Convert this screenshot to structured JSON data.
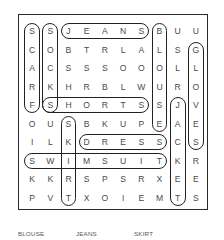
{
  "puzzle": {
    "rows": 10,
    "cols": 10,
    "grid": [
      [
        "S",
        "S",
        "J",
        "E",
        "A",
        "N",
        "S",
        "B",
        "U",
        "U"
      ],
      [
        "C",
        "O",
        "B",
        "T",
        "R",
        "L",
        "A",
        "L",
        "S",
        "G"
      ],
      [
        "A",
        "C",
        "S",
        "S",
        "S",
        "O",
        "O",
        "O",
        "L",
        "L"
      ],
      [
        "R",
        "K",
        "H",
        "R",
        "B",
        "L",
        "W",
        "U",
        "R",
        "O"
      ],
      [
        "F",
        "S",
        "H",
        "O",
        "R",
        "T",
        "S",
        "S",
        "J",
        "V"
      ],
      [
        "O",
        "U",
        "S",
        "B",
        "K",
        "U",
        "P",
        "E",
        "A",
        "E"
      ],
      [
        "I",
        "L",
        "K",
        "D",
        "R",
        "E",
        "S",
        "S",
        "C",
        "S"
      ],
      [
        "S",
        "W",
        "I",
        "M",
        "S",
        "U",
        "I",
        "T",
        "K",
        "R"
      ],
      [
        "K",
        "K",
        "R",
        "S",
        "P",
        "S",
        "R",
        "X",
        "E",
        "E"
      ],
      [
        "P",
        "V",
        "T",
        "X",
        "O",
        "I",
        "E",
        "M",
        "T",
        "S"
      ]
    ],
    "found_words": [
      {
        "word": "SCARF",
        "row": 0,
        "col": 0,
        "dir": "down",
        "length": 5
      },
      {
        "word": "SOCKS",
        "row": 0,
        "col": 1,
        "dir": "down",
        "length": 5
      },
      {
        "word": "JEANS",
        "row": 0,
        "col": 2,
        "dir": "right",
        "length": 5
      },
      {
        "word": "BLOUSE",
        "row": 0,
        "col": 7,
        "dir": "down",
        "length": 6
      },
      {
        "word": "GLOVES",
        "row": 1,
        "col": 9,
        "dir": "down",
        "length": 6
      },
      {
        "word": "SHORTS",
        "row": 4,
        "col": 1,
        "dir": "right",
        "length": 6
      },
      {
        "word": "JACKET",
        "row": 4,
        "col": 8,
        "dir": "down",
        "length": 6
      },
      {
        "word": "SKIRT",
        "row": 5,
        "col": 2,
        "dir": "down",
        "length": 5
      },
      {
        "word": "DRESS",
        "row": 6,
        "col": 3,
        "dir": "right",
        "length": 5
      },
      {
        "word": "SWIMSUIT",
        "row": 7,
        "col": 0,
        "dir": "right",
        "length": 8
      }
    ],
    "colors": {
      "frame": "#2a2a2a",
      "capsule": "#222222",
      "letter": "#4a4a4a",
      "word_list": "#555555"
    }
  },
  "word_list": {
    "items": [
      "BLOUSE",
      "JEANS",
      "SKIRT"
    ]
  }
}
